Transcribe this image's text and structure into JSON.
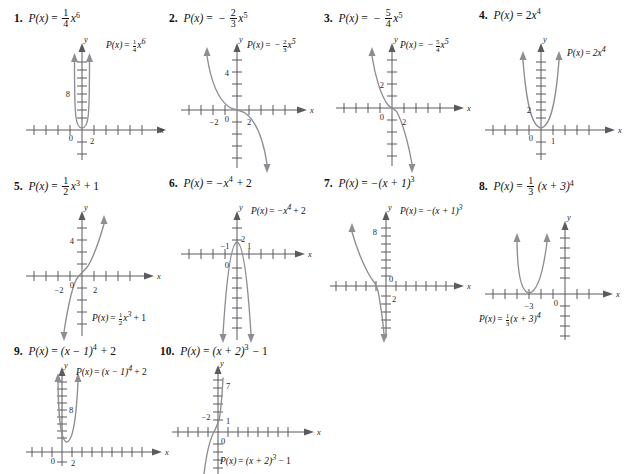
{
  "page": {
    "kind": "math-worksheet-answer-key",
    "background_color": "#ffffff",
    "text_color": "#111111",
    "curve_color": "#8d8d93",
    "axis_color": "#5a5a5f",
    "columns": 4,
    "rows": 3
  },
  "problems": [
    {
      "number": "1.",
      "fx": "P(x)",
      "equals": "=",
      "coef_num": "1",
      "coef_den": "4",
      "base": "x",
      "exponent": "6",
      "label_plain": "P(x) = 1/4 x^6",
      "graph": {
        "x_axis_label": "x",
        "y_axis_label": "y",
        "origin_label": "0",
        "y_tick_label": "8",
        "x_tick_label": "2"
      }
    },
    {
      "number": "2.",
      "fx": "P(x)",
      "equals": "=",
      "sign": "−",
      "coef_num": "2",
      "coef_den": "3",
      "base": "x",
      "exponent": "5",
      "label_plain": "P(x) = -2/3 x^5",
      "graph": {
        "x_axis_label": "x",
        "y_axis_label": "y",
        "origin_label": "0",
        "y_tick_label": "4",
        "x_tick_label_neg": "−2",
        "x_tick_label": "2"
      }
    },
    {
      "number": "3.",
      "fx": "P(x)",
      "equals": "=",
      "sign": "−",
      "coef_num": "5",
      "coef_den": "4",
      "base": "x",
      "exponent": "5",
      "label_plain": "P(x) = -5/4 x^5",
      "graph": {
        "x_axis_label": "x",
        "y_axis_label": "y",
        "origin_label": "0",
        "y_tick_label": "2",
        "x_tick_label": "2"
      }
    },
    {
      "number": "4.",
      "fx": "P(x)",
      "equals": "=",
      "coef": "2",
      "base": "x",
      "exponent": "4",
      "label_plain": "P(x) = 2x^4",
      "graph": {
        "x_axis_label": "x",
        "y_axis_label": "y",
        "origin_label": "0",
        "y_tick_label": "2",
        "x_tick_label": "1"
      }
    },
    {
      "number": "5.",
      "fx": "P(x)",
      "equals": "=",
      "coef_num": "1",
      "coef_den": "2",
      "base": "x",
      "exponent": "3",
      "constant": "+ 1",
      "label_plain": "P(x) = 1/2 x^3 + 1",
      "graph": {
        "x_axis_label": "x",
        "y_axis_label": "y",
        "origin_label": "0",
        "y_tick_label": "4",
        "x_tick_label_neg": "−2",
        "x_tick_label": "2"
      }
    },
    {
      "number": "6.",
      "fx": "P(x)",
      "equals": "=",
      "body": "−x",
      "exponent": "4",
      "constant": "+ 2",
      "label_plain": "P(x) = -x^4 + 2",
      "graph": {
        "x_axis_label": "x",
        "y_axis_label": "y",
        "origin_label": "0",
        "y_tick_label": "2",
        "x_tick_label_neg": "−1",
        "x_tick_label": "1"
      }
    },
    {
      "number": "7.",
      "fx": "P(x)",
      "equals": "=",
      "body": "−(x + 1)",
      "exponent": "3",
      "label_plain": "P(x) = -(x + 1)^3",
      "graph": {
        "x_axis_label": "x",
        "y_axis_label": "y",
        "origin_label": "0",
        "y_tick_label": "8",
        "x_tick_label": "2"
      }
    },
    {
      "number": "8.",
      "fx": "P(x)",
      "equals": "=",
      "coef_num": "1",
      "coef_den": "3",
      "body": "(x + 3)",
      "exponent": "4",
      "label_plain": "P(x) = 1/3 (x + 3)^4",
      "graph": {
        "x_axis_label": "x",
        "y_axis_label": "y",
        "origin_label": "0",
        "x_tick_label_neg": "−3"
      }
    },
    {
      "number": "9.",
      "fx": "P(x)",
      "equals": "=",
      "body": "(x − 1)",
      "exponent": "4",
      "constant": "+ 2",
      "label_plain": "P(x) = (x - 1)^4 + 2",
      "graph": {
        "x_axis_label": "x",
        "y_axis_label": "y",
        "origin_label": "0",
        "y_tick_label": "8",
        "x_tick_label": "2"
      }
    },
    {
      "number": "10.",
      "fx": "P(x)",
      "equals": "=",
      "body": "(x + 2)",
      "exponent": "3",
      "constant": "− 1",
      "label_plain": "P(x) = (x + 2)^3 - 1",
      "graph": {
        "x_axis_label": "x",
        "y_axis_label": "y",
        "origin_label": "0",
        "y_tick_label": "7",
        "y_tick_label2": "1",
        "x_tick_label_neg": "−2"
      }
    }
  ]
}
